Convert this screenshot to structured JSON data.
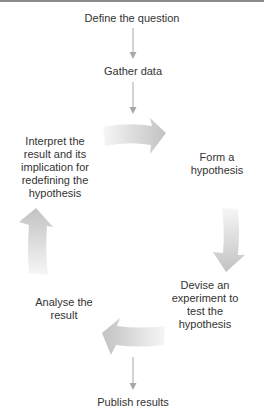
{
  "diagram": {
    "type": "process-cycle",
    "colors": {
      "text": "#333333",
      "connector": "#a8a8a8",
      "cycle_arrow_light": "#f4f4f4",
      "cycle_arrow_dark": "#c4c4c4",
      "top_rule": "#8c8c8c"
    },
    "nodes": {
      "define_question": "Define the question",
      "gather_data": "Gather data",
      "form_hypothesis": "Form a\nhypothesis",
      "devise_experiment": "Devise an\nexperiment to\ntest the\nhypothesis",
      "analyse_result": "Analyse the\nresult",
      "interpret_result": "Interpret the\nresult and its\nimplication for\nredefining the\nhypothesis",
      "publish_results": "Publish results"
    },
    "edges": [
      {
        "from": "Define the question",
        "to": "Gather data",
        "style": "thin-arrow"
      },
      {
        "from": "Gather data",
        "to": "Cycle (top)",
        "style": "thin-arrow"
      },
      {
        "from": "Interpret the result",
        "to": "Form a hypothesis",
        "style": "cycle-arrow",
        "direction": "right"
      },
      {
        "from": "Form a hypothesis",
        "to": "Devise an experiment",
        "style": "cycle-arrow",
        "direction": "down"
      },
      {
        "from": "Devise an experiment",
        "to": "Analyse the result",
        "style": "cycle-arrow",
        "direction": "left"
      },
      {
        "from": "Analyse the result",
        "to": "Interpret the result",
        "style": "cycle-arrow",
        "direction": "up"
      },
      {
        "from": "Cycle (bottom)",
        "to": "Publish results",
        "style": "thin-arrow"
      }
    ]
  }
}
